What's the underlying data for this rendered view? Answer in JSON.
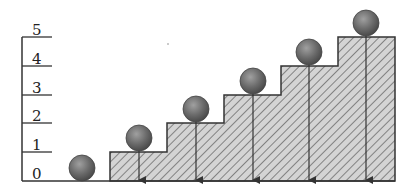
{
  "diagram": {
    "axis": {
      "labels": [
        "0",
        "1",
        "2",
        "3",
        "4",
        "5"
      ],
      "min": 0,
      "max": 5
    },
    "steps": [
      {
        "level": 1
      },
      {
        "level": 2
      },
      {
        "level": 3
      },
      {
        "level": 4
      },
      {
        "level": 5
      }
    ],
    "balls": [
      {
        "level": 0,
        "arrow": false
      },
      {
        "level": 1,
        "arrow": true
      },
      {
        "level": 2,
        "arrow": true
      },
      {
        "level": 3,
        "arrow": true
      },
      {
        "level": 4,
        "arrow": true
      },
      {
        "level": 5,
        "arrow": true
      }
    ],
    "colors": {
      "line": "#333333",
      "hatch_fill": "#d4d4d4",
      "hatch_stroke": "#555555",
      "ball": "#6e6e6e",
      "ball_highlight": "#9a9a9a"
    }
  }
}
